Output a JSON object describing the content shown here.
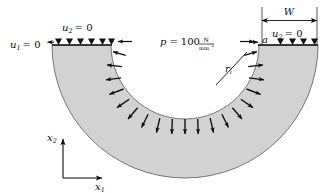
{
  "figure": {
    "type": "engineering-diagram",
    "colors": {
      "material_fill": "#d2d2d2",
      "outline": "#4a4a4a",
      "ink": "#0d0d0d",
      "background": "#ffffff"
    }
  },
  "labels": {
    "bc_left": {
      "symbol": "u",
      "subscript": "1",
      "equals": "= 0",
      "text": "u1 = 0"
    },
    "bc_top_left": {
      "symbol": "u",
      "subscript": "2",
      "equals": "= 0",
      "text": "u2 = 0"
    },
    "bc_top_right": {
      "symbol": "u",
      "subscript": "2",
      "equals": "= 0",
      "text": "u2 = 0"
    },
    "pressure": {
      "symbol": "p",
      "equals": "=",
      "value": "100",
      "unit_numerator": "N",
      "unit_denominator": "mm",
      "unit_exponent": "2",
      "text": "p = 100 N/mm2"
    },
    "inner_radius": {
      "symbol": "r",
      "subscript": "i",
      "text": "ri"
    },
    "width": {
      "symbol": "W",
      "text": "W"
    },
    "crack_length": {
      "symbol": "a",
      "text": "a"
    },
    "axis_x1": {
      "symbol": "x",
      "subscript": "1",
      "text": "x1"
    },
    "axis_x2": {
      "symbol": "x",
      "subscript": "2",
      "text": "x2"
    }
  },
  "geometry": {
    "center_x": 185,
    "center_y": 45,
    "inner_radius_px": 74,
    "outer_radius_px": 133,
    "top_surface_y": 45,
    "left_outer_x": 52,
    "right_outer_x": 318,
    "bottom_y": 178
  },
  "supports": {
    "left_group_count": 6,
    "right_group_count": 4,
    "glyph": "triangle"
  },
  "pressure_arrows": {
    "count": 19,
    "direction": "outward-from-center",
    "description": "radial arrows on inner surface pointing into the material"
  },
  "dimension_lines": [
    {
      "name": "W",
      "orientation": "horizontal",
      "arrows": "both-ends"
    }
  ],
  "load_arrows": [
    {
      "name": "left-edge-arrow",
      "direction": "left",
      "note": "arrow pointing left at left end of top surface"
    },
    {
      "name": "inner-top-left-arrow",
      "direction": "left",
      "note": "arrow at top-left of inner bore"
    },
    {
      "name": "inner-top-right-arrow",
      "direction": "right",
      "note": "arrow at top-right of inner bore"
    }
  ]
}
